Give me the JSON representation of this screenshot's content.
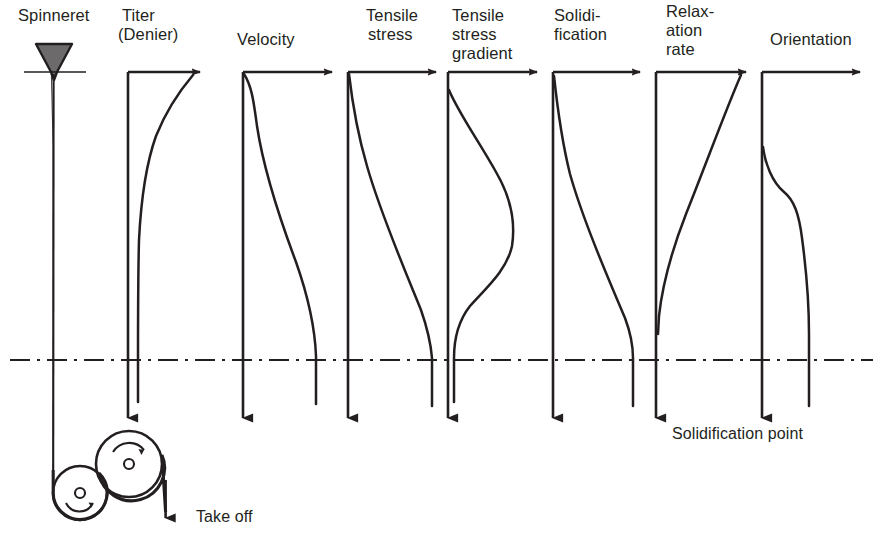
{
  "figure": {
    "background_color": "#ffffff",
    "ink_color": "#231f20"
  },
  "spinneret": {
    "label": "Spinneret",
    "label_x": 18,
    "label_y": 8,
    "shape": "funnel",
    "cone_top_left_x": 36,
    "cone_top_right_x": 72,
    "cone_top_y": 44,
    "cone_tip_x": 54,
    "cone_tip_y": 78,
    "plate_y": 72,
    "plate_left_x": 24,
    "plate_right_x": 86,
    "filament_x": 53,
    "filament_top_y": 72,
    "filament_bottom_y": 470
  },
  "takeoff": {
    "label": "Take off",
    "label_x": 196,
    "label_y": 508,
    "rollers": [
      {
        "name": "godet-roller-left",
        "cx": 80,
        "cy": 493,
        "r": 27,
        "hub_r": 5,
        "spin_arrow": "ccw-bottom"
      },
      {
        "name": "godet-roller-right",
        "cx": 129,
        "cy": 464,
        "r": 33,
        "hub_r": 5,
        "spin_arrow": "cw-top"
      }
    ],
    "exit_line_x": 166,
    "exit_arrow_y": 522
  },
  "solidification": {
    "label": "Solidification point",
    "label_x": 672,
    "label_y": 425,
    "line_y": 360,
    "line_x_start": 10,
    "line_x_end": 873,
    "line_style": "dash-dot"
  },
  "axes_geometry": {
    "top_y": 72,
    "bottom_arrow_y": 414,
    "axis_length": 342
  },
  "panels": [
    {
      "id": "titer",
      "label_lines": [
        "Titer",
        "(Denier)"
      ],
      "label_x": 122,
      "label_y": 8,
      "axis_x": 128,
      "axis_top_y": 72,
      "axis_bottom_y": 416,
      "h_axis_end_x": 196,
      "curve_name": "titer-curve",
      "curve_description": "high at top right, decays steeply to a near-vertical asymptote close to the ordinate; continues past solidification line",
      "curve_points": [
        [
          192,
          74
        ],
        [
          184,
          84
        ],
        [
          173,
          98
        ],
        [
          162,
          118
        ],
        [
          152,
          146
        ],
        [
          145,
          178
        ],
        [
          141,
          214
        ],
        [
          139,
          250
        ],
        [
          138,
          290
        ],
        [
          138,
          330
        ],
        [
          138,
          360
        ],
        [
          138,
          400
        ]
      ],
      "value_axis_max_x": 196
    },
    {
      "id": "velocity",
      "label_lines": [
        "Velocity"
      ],
      "label_x": 237,
      "label_y": 32,
      "axis_x": 243,
      "axis_top_y": 72,
      "axis_bottom_y": 416,
      "h_axis_end_x": 328,
      "curve_name": "velocity-curve",
      "curve_description": "sigmoidal rise: starts near the ordinate at the top, inflects mid-spinline, plateaus at the solidification line and stays constant below",
      "curve_points": [
        [
          245,
          74
        ],
        [
          250,
          86
        ],
        [
          253,
          100
        ],
        [
          256,
          120
        ],
        [
          262,
          150
        ],
        [
          272,
          190
        ],
        [
          285,
          232
        ],
        [
          298,
          268
        ],
        [
          308,
          300
        ],
        [
          314,
          330
        ],
        [
          316,
          352
        ],
        [
          316,
          360
        ],
        [
          316,
          405
        ]
      ]
    },
    {
      "id": "tensile-stress",
      "label_lines": [
        "Tensile",
        "stress"
      ],
      "label_x": 352,
      "label_y": 8,
      "axis_x": 348,
      "axis_top_y": 72,
      "axis_bottom_y": 416,
      "h_axis_end_x": 432,
      "curve_name": "tensile-stress-curve",
      "curve_description": "monotonic sigmoidal increase from zero at the spinneret to a maximum at the solidification point",
      "curve_points": [
        [
          350,
          74
        ],
        [
          352,
          92
        ],
        [
          355,
          115
        ],
        [
          360,
          142
        ],
        [
          368,
          172
        ],
        [
          379,
          204
        ],
        [
          392,
          238
        ],
        [
          406,
          272
        ],
        [
          418,
          304
        ],
        [
          427,
          332
        ],
        [
          431,
          352
        ],
        [
          432,
          360
        ],
        [
          432,
          406
        ]
      ]
    },
    {
      "id": "tensile-stress-gradient",
      "label_lines": [
        "Tensile",
        "stress",
        "gradient"
      ],
      "label_x": 451,
      "label_y": 8,
      "axis_x": 448,
      "axis_top_y": 72,
      "axis_bottom_y": 416,
      "h_axis_end_x": 533,
      "curve_name": "tensile-stress-gradient-curve",
      "curve_description": "bell shaped hump: rises from the ordinate near the top to a broad maximum around mid spinline, then falls back to near zero before the solidification line",
      "curve_points": [
        [
          449,
          90
        ],
        [
          456,
          106
        ],
        [
          466,
          124
        ],
        [
          478,
          144
        ],
        [
          492,
          168
        ],
        [
          504,
          192
        ],
        [
          512,
          214
        ],
        [
          514,
          232
        ],
        [
          510,
          250
        ],
        [
          499,
          268
        ],
        [
          485,
          284
        ],
        [
          472,
          298
        ],
        [
          462,
          312
        ],
        [
          456,
          328
        ],
        [
          454,
          346
        ],
        [
          454,
          360
        ],
        [
          454,
          404
        ]
      ]
    },
    {
      "id": "solidification-panel",
      "label_lines": [
        "Solidi-",
        "fication"
      ],
      "label_x": 556,
      "label_y": 8,
      "axis_x": 553,
      "axis_top_y": 72,
      "axis_bottom_y": 416,
      "h_axis_end_x": 636,
      "curve_name": "solidification-curve",
      "curve_description": "degree of solidification rises slowly then steeply, reaching full value exactly at the solidification point and remaining constant",
      "curve_points": [
        [
          554,
          76
        ],
        [
          556,
          96
        ],
        [
          559,
          120
        ],
        [
          564,
          148
        ],
        [
          572,
          180
        ],
        [
          583,
          212
        ],
        [
          596,
          246
        ],
        [
          610,
          280
        ],
        [
          622,
          312
        ],
        [
          630,
          338
        ],
        [
          633,
          354
        ],
        [
          633,
          360
        ],
        [
          633,
          406
        ]
      ]
    },
    {
      "id": "relaxation-rate",
      "label_lines": [
        "Relax-",
        "ation",
        "rate"
      ],
      "label_x": 664,
      "label_y": 4,
      "axis_x": 656,
      "axis_top_y": 72,
      "axis_bottom_y": 416,
      "h_axis_end_x": 742,
      "curve_name": "relaxation-rate-curve",
      "curve_description": "highest immediately below the spinneret, decays continuously and reaches essentially zero just above the solidification point",
      "curve_points": [
        [
          740,
          76
        ],
        [
          733,
          96
        ],
        [
          725,
          118
        ],
        [
          715,
          142
        ],
        [
          703,
          170
        ],
        [
          691,
          198
        ],
        [
          681,
          224
        ],
        [
          672,
          252
        ],
        [
          665,
          280
        ],
        [
          661,
          302
        ],
        [
          659,
          320
        ],
        [
          658,
          332
        ]
      ]
    },
    {
      "id": "orientation",
      "label_lines": [
        "Orientation"
      ],
      "label_x": 768,
      "label_y": 32,
      "axis_x": 762,
      "axis_top_y": 72,
      "axis_bottom_y": 416,
      "h_axis_end_x": 856,
      "curve_name": "orientation-curve",
      "curve_description": "negligible near the spinneret, develops in two stages with a shoulder, then rises to its final frozen-in value at the solidification point",
      "curve_points": [
        [
          763,
          148
        ],
        [
          766,
          162
        ],
        [
          771,
          176
        ],
        [
          778,
          188
        ],
        [
          786,
          196
        ],
        [
          793,
          204
        ],
        [
          797,
          216
        ],
        [
          800,
          232
        ],
        [
          803,
          252
        ],
        [
          806,
          274
        ],
        [
          808,
          298
        ],
        [
          809,
          322
        ],
        [
          809,
          348
        ],
        [
          809,
          360
        ],
        [
          809,
          406
        ]
      ]
    }
  ]
}
